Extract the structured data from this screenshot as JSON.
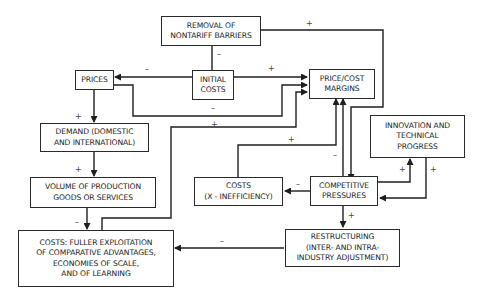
{
  "diagram": {
    "nodes": {
      "removal": "REMOVAL OF\nNONTARIFF BARRIERS",
      "initial_costs": "INITIAL\nCOSTS",
      "prices": "PRICES",
      "margins": "PRICE/COST\nMARGINS",
      "demand": "DEMAND (DOMESTIC\nAND INTERNATIONAL)",
      "volume": "VOLUME OF PRODUCTION\nGOODS OR SERVICES",
      "innovation": "INNOVATION AND\nTECHNICAL\nPROGRESS",
      "x_costs": "COSTS\n(X - INEFFICIENCY)",
      "competitive": "COMPETITIVE\nPRESSURES",
      "restructuring": "RESTRUCTURING\n(INTER- AND INTRA-\nINDUSTRY ADJUSTMENT)",
      "fuller_costs": "COSTS: FULLER EXPLOITATION\nOF COMPARATIVE ADVANTAGES,\nECONOMIES OF SCALE,\nAND OF LEARNING"
    },
    "edges": [
      {
        "from": "removal",
        "to": "initial_costs",
        "sign": "–"
      },
      {
        "from": "removal",
        "to": "competitive",
        "sign": "+"
      },
      {
        "from": "initial_costs",
        "to": "prices",
        "sign": "–"
      },
      {
        "from": "initial_costs",
        "to": "margins",
        "sign": "+"
      },
      {
        "from": "prices",
        "to": "margins",
        "sign": "–"
      },
      {
        "from": "prices",
        "to": "demand",
        "sign": "+"
      },
      {
        "from": "demand",
        "to": "volume",
        "sign": "+"
      },
      {
        "from": "volume",
        "to": "fuller_costs",
        "sign": "–"
      },
      {
        "from": "fuller_costs",
        "to": "margins",
        "sign": "+"
      },
      {
        "from": "x_costs",
        "to": "margins",
        "sign": "+"
      },
      {
        "from": "competitive",
        "to": "margins",
        "sign": "–"
      },
      {
        "from": "competitive",
        "to": "x_costs",
        "sign": "–"
      },
      {
        "from": "competitive",
        "to": "innovation",
        "sign": "+"
      },
      {
        "from": "innovation",
        "to": "competitive",
        "sign": "+"
      },
      {
        "from": "competitive",
        "to": "restructuring",
        "sign": "+"
      },
      {
        "from": "restructuring",
        "to": "fuller_costs",
        "sign": "–"
      }
    ],
    "signs": {
      "plus": "+",
      "minus": "–"
    }
  }
}
